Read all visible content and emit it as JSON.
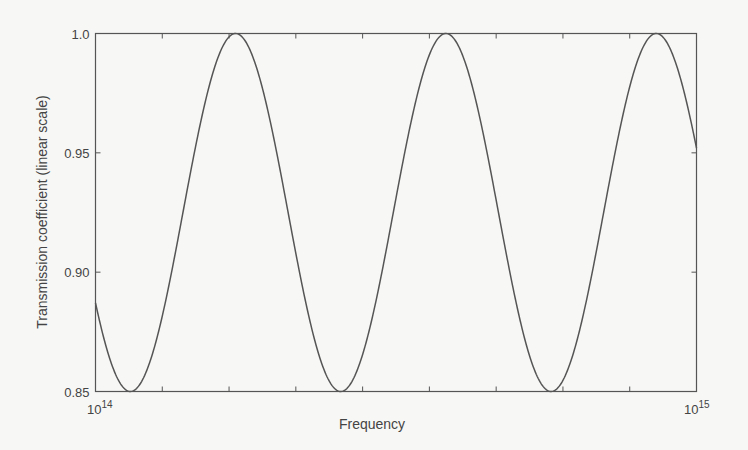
{
  "chart_data": {
    "type": "line",
    "title": "",
    "xlabel": "Frequency",
    "ylabel": "Transmission coefficient (linear scale)",
    "xscale": "log",
    "xlim": [
      100000000000000.0,
      1000000000000000.0
    ],
    "ylim": [
      0.85,
      1.0
    ],
    "x_tick_labels": [
      {
        "base": "10",
        "exp": "14"
      },
      {
        "base": "10",
        "exp": "15"
      }
    ],
    "y_tick_labels": [
      "1.0",
      "0.95",
      "0.90",
      "0.85"
    ],
    "y_ticks": [
      1.0,
      0.95,
      0.9,
      0.85
    ],
    "x_minor_ticks_count": 8,
    "grid": false,
    "legend": null,
    "series": [
      {
        "name": "transmission",
        "color": "#555555",
        "description": "periodic oscillation between 0.85 and 1.0, ~2.86 cycles across the decade",
        "x": [
          100000000000000.0,
          115000000000000.0,
          125000000000000.0,
          140000000000000.0,
          160000000000000.0,
          185000000000000.0,
          210000000000000.0,
          245000000000000.0,
          280000000000000.0,
          330000000000000.0,
          390000000000000.0,
          440000000000000.0,
          510000000000000.0,
          600000000000000.0,
          710000000000000.0,
          800000000000000.0,
          900000000000000.0,
          1000000000000000.0
        ],
        "y": [
          0.888,
          0.858,
          0.85,
          0.862,
          0.905,
          0.97,
          1.0,
          0.965,
          0.895,
          0.85,
          0.88,
          0.955,
          1.0,
          0.935,
          0.858,
          0.88,
          0.985,
          0.952
        ]
      }
    ],
    "peaks_x": [
      188000000000000.0,
      496000000000000.0,
      1260000000000000.0
    ],
    "curve_model": {
      "mean": 0.925,
      "amplitude": 0.075,
      "period_fraction_of_decade": 0.35,
      "peak_phase_fraction": 0.233
    }
  }
}
